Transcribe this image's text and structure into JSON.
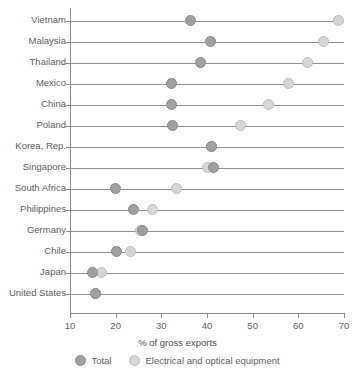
{
  "chart_data": {
    "type": "scatter",
    "title": "",
    "xlabel": "% of gross exports",
    "ylabel": "",
    "xlim": [
      10,
      70
    ],
    "xticks": [
      10,
      20,
      30,
      40,
      50,
      60,
      70
    ],
    "grid": false,
    "legend_position": "bottom",
    "categories": [
      "Vietnam",
      "Malaysia",
      "Thailand",
      "Mexico",
      "China",
      "Poland",
      "Korea, Rep.",
      "Singapore",
      "South Africa",
      "Philippines",
      "Germany",
      "Chile",
      "Japan",
      "United States"
    ],
    "series": [
      {
        "name": "Total",
        "color": "#a0a0a0",
        "values": [
          36.3,
          40.7,
          38.5,
          32.2,
          32.2,
          32.4,
          41.0,
          41.4,
          20.0,
          23.8,
          25.8,
          20.1,
          15.0,
          15.6
        ]
      },
      {
        "name": "Electrical and optical equipment",
        "color": "#d6d6d6",
        "values": [
          68.8,
          65.5,
          62.0,
          57.8,
          53.4,
          47.3,
          41.0,
          40.0,
          33.3,
          28.0,
          25.4,
          23.2,
          16.8,
          15.5
        ]
      }
    ]
  },
  "legend": {
    "items": [
      {
        "label": "Total"
      },
      {
        "label": "Electrical and optical equipment"
      }
    ]
  }
}
